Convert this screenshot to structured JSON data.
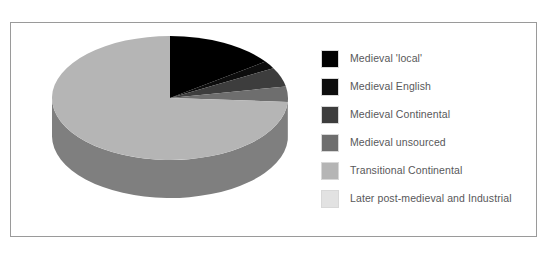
{
  "chart_data": {
    "type": "pie",
    "title": "",
    "subtitle": "",
    "xlabel": "",
    "ylabel": "",
    "three_d": true,
    "start_angle_deg": 0,
    "direction": "clockwise",
    "legend_position": "right",
    "grid": false,
    "categories": [
      "Medieval 'local'",
      "Medieval English",
      "Medieval Continental",
      "Medieval unsourced",
      "Transitional Continental",
      "Later post-medieval and Industrial"
    ],
    "values": [
      15,
      2,
      5,
      4,
      74,
      0
    ],
    "colors": [
      "#000000",
      "#0d0d0d",
      "#3d3d3d",
      "#6e6e6e",
      "#b5b5b5",
      "#e2e2e2"
    ],
    "side_colors": [
      "#000000",
      "#070707",
      "#2b2b2b",
      "#4e4e4e",
      "#7f7f7f",
      "#a5a5a5"
    ]
  },
  "legend": {
    "items": [
      {
        "label": "Medieval 'local'",
        "color": "#000000"
      },
      {
        "label": "Medieval English",
        "color": "#0d0d0d"
      },
      {
        "label": "Medieval Continental",
        "color": "#3d3d3d"
      },
      {
        "label": "Medieval unsourced",
        "color": "#6e6e6e"
      },
      {
        "label": "Transitional Continental",
        "color": "#b5b5b5"
      },
      {
        "label": "Later post-medieval and Industrial",
        "color": "#e2e2e2"
      }
    ]
  },
  "frame": {
    "border_color": "#9a9a9a",
    "background": "#ffffff"
  }
}
